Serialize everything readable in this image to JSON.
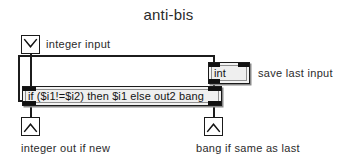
{
  "patch": {
    "title": "anti-bis",
    "background_color": "#ffffff",
    "line_color": "#1c1c1c",
    "box_fill": "#efefef"
  },
  "inlets": [
    {
      "name": "integer-inlet",
      "icon": "inlet-chevron-down-icon",
      "comment": "integer input"
    }
  ],
  "objects": [
    {
      "name": "int-object",
      "text": "int",
      "comment": "save last input"
    },
    {
      "name": "expr-object",
      "text": "if ($i1!=$i2) then $i1 else out2 bang"
    }
  ],
  "outlets": [
    {
      "name": "integer-outlet",
      "icon": "outlet-chevron-up-icon",
      "comment": "integer out if new"
    },
    {
      "name": "bang-outlet",
      "icon": "outlet-chevron-up-icon",
      "comment": "bang if same as last"
    }
  ],
  "comments": {
    "integer_input": "integer input",
    "save_last_input": "save last input",
    "integer_out_if_new": "integer out if new",
    "bang_if_same_as_last": "bang if same as last"
  }
}
